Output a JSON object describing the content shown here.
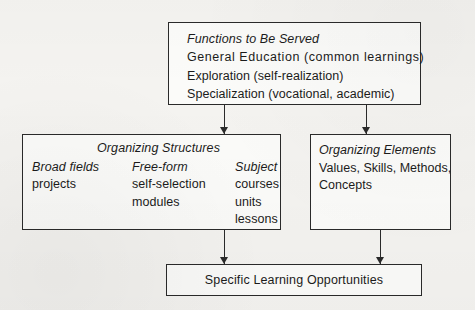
{
  "diagram": {
    "background_color": "#f4f3f0",
    "line_color": "#2a2a2a",
    "box_fill_color": "#fbfbf9"
  },
  "functions_box": {
    "heading": "Functions to Be Served",
    "lines": [
      "General  Education  (common  learnings)",
      "Exploration (self-realization)",
      "Specialization (vocational, academic)"
    ]
  },
  "structures_box": {
    "title": "Organizing Structures",
    "columns": [
      {
        "heading": "Broad fields",
        "items": [
          "projects"
        ]
      },
      {
        "heading": "Free-form",
        "items": [
          "self-selection",
          "modules"
        ]
      },
      {
        "heading": "Subject",
        "items": [
          "courses",
          "units",
          "lessons"
        ]
      }
    ]
  },
  "elements_box": {
    "heading": "Organizing Elements",
    "lines": [
      "Values, Skills, Methods,",
      "Concepts"
    ]
  },
  "outcome_box": {
    "label": "Specific Learning Opportunities"
  },
  "connectors": [
    {
      "name": "functions-to-structures",
      "from": "functions_box",
      "to": "structures_box"
    },
    {
      "name": "functions-to-elements",
      "from": "functions_box",
      "to": "elements_box"
    },
    {
      "name": "structures-to-outcome",
      "from": "structures_box",
      "to": "outcome_box"
    },
    {
      "name": "elements-to-outcome",
      "from": "elements_box",
      "to": "outcome_box"
    }
  ]
}
